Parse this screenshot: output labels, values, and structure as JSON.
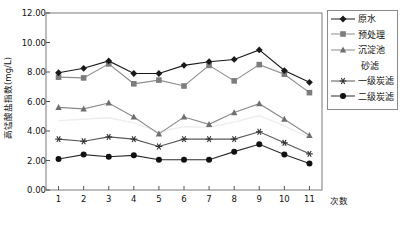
{
  "chart_data": {
    "type": "line",
    "title": "",
    "xlabel": "次数",
    "ylabel": "高锰酸盐指数(mg/L)",
    "x": [
      1,
      2,
      3,
      4,
      5,
      6,
      7,
      8,
      9,
      10,
      11
    ],
    "categories": [
      "1",
      "2",
      "3",
      "4",
      "5",
      "6",
      "7",
      "8",
      "9",
      "10",
      "11"
    ],
    "xlim": [
      0.5,
      11.5
    ],
    "ylim": [
      0.0,
      12.0
    ],
    "ytick_labels": [
      "0.00",
      "2.00",
      "4.00",
      "6.00",
      "8.00",
      "10.00",
      "12.00"
    ],
    "ytick_values": [
      0,
      2,
      4,
      6,
      8,
      10,
      12
    ],
    "grid": false,
    "legend_position": "right-outside",
    "series": [
      {
        "name": "原水",
        "marker": "diamond",
        "color": "#1a1a1a",
        "line_color": "#1a1a1a",
        "values": [
          7.95,
          8.25,
          8.75,
          7.9,
          7.9,
          8.45,
          8.7,
          8.85,
          9.5,
          8.1,
          7.3
        ]
      },
      {
        "name": "预处理",
        "marker": "square",
        "color": "#7d7d7d",
        "line_color": "#8c8c8c",
        "values": [
          7.65,
          7.6,
          8.55,
          7.2,
          7.45,
          7.05,
          8.45,
          7.4,
          8.5,
          7.85,
          6.6
        ]
      },
      {
        "name": "沉淀池",
        "marker": "triangle",
        "color": "#6f6f6f",
        "line_color": "#8a8a8a",
        "values": [
          5.6,
          5.5,
          5.9,
          4.95,
          3.8,
          4.95,
          4.45,
          5.25,
          5.85,
          4.8,
          3.7
        ]
      },
      {
        "name": "砂滤",
        "marker": "none",
        "color": "#ededed",
        "line_color": "#ededed",
        "values": [
          4.7,
          4.8,
          4.9,
          4.55,
          3.95,
          4.3,
          4.25,
          4.6,
          5.05,
          4.35,
          3.55
        ]
      },
      {
        "name": "一级炭滤",
        "marker": "asterisk",
        "color": "#303030",
        "line_color": "#5a5a5a",
        "values": [
          3.45,
          3.3,
          3.6,
          3.45,
          2.95,
          3.45,
          3.45,
          3.45,
          3.95,
          3.2,
          2.45
        ]
      },
      {
        "name": "二级炭滤",
        "marker": "circle",
        "color": "#111111",
        "line_color": "#2b2b2b",
        "values": [
          2.1,
          2.4,
          2.25,
          2.35,
          2.05,
          2.05,
          2.05,
          2.6,
          3.1,
          2.4,
          1.8
        ]
      }
    ]
  },
  "legend": {
    "entries": [
      {
        "label": "原水",
        "marker": "diamond"
      },
      {
        "label": "预处理",
        "marker": "square"
      },
      {
        "label": "沉淀池",
        "marker": "triangle"
      },
      {
        "label": "砂滤",
        "marker": "none"
      },
      {
        "label": "一级炭滤",
        "marker": "asterisk"
      },
      {
        "label": "二级炭滤",
        "marker": "circle"
      }
    ]
  },
  "axes": {
    "y_label": "高锰酸盐指数(mg/L)",
    "x_label": "次数",
    "y_ticks": [
      "12.00",
      "10.00",
      "8.00",
      "6.00",
      "4.00",
      "2.00",
      "0.00"
    ],
    "x_ticks": [
      "1",
      "2",
      "3",
      "4",
      "5",
      "6",
      "7",
      "8",
      "9",
      "10",
      "11"
    ]
  }
}
